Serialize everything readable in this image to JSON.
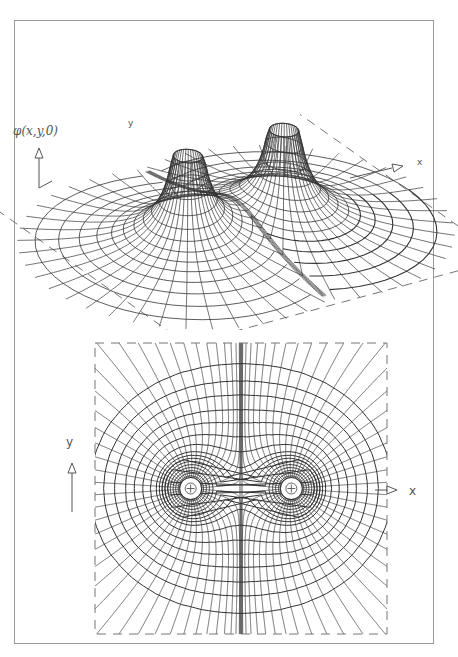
{
  "figure": {
    "top_panel": {
      "title": "3D surface of electrostatic potential of two equal point charges",
      "z_axis_label": "φ(x,y,0)",
      "x_axis_label": "x",
      "y_axis_label": "y"
    },
    "bottom_panel": {
      "title": "Equipotential lines and field lines in the x-y plane",
      "x_axis_label": "x",
      "y_axis_label": "y",
      "charges": [
        {
          "symbol": "+",
          "x": -1,
          "y": 0
        },
        {
          "symbol": "+",
          "x": 1,
          "y": 0
        }
      ]
    },
    "colors": {
      "line": "#333333",
      "frame": "#9a9a9a",
      "dashed": "#777777",
      "background": "#ffffff"
    }
  }
}
